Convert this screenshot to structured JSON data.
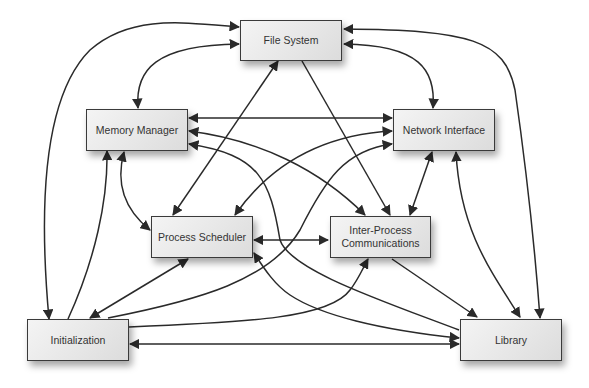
{
  "diagram": {
    "type": "module-dependency-graph",
    "nodes": [
      {
        "id": "fs",
        "label": "File System",
        "lines": [
          "File System"
        ]
      },
      {
        "id": "mm",
        "label": "Memory Manager",
        "lines": [
          "Memory Manager"
        ]
      },
      {
        "id": "ni",
        "label": "Network Interface",
        "lines": [
          "Network Interface"
        ]
      },
      {
        "id": "ps",
        "label": "Process Scheduler",
        "lines": [
          "Process Scheduler"
        ]
      },
      {
        "id": "ipc",
        "label": "Inter-Process Communications",
        "lines": [
          "Inter-Process",
          "Communications"
        ]
      },
      {
        "id": "init",
        "label": "Initialization",
        "lines": [
          "Initialization"
        ]
      },
      {
        "id": "lib",
        "label": "Library",
        "lines": [
          "Library"
        ]
      }
    ],
    "edges": [
      {
        "from": "init",
        "to": "fs",
        "direction": "both"
      },
      {
        "from": "mm",
        "to": "fs",
        "direction": "both"
      },
      {
        "from": "ni",
        "to": "fs",
        "direction": "both"
      },
      {
        "from": "lib",
        "to": "fs",
        "direction": "both"
      },
      {
        "from": "ps",
        "to": "fs",
        "direction": "both"
      },
      {
        "from": "fs",
        "to": "ipc",
        "direction": "forward"
      },
      {
        "from": "mm",
        "to": "ni",
        "direction": "both"
      },
      {
        "from": "mm",
        "to": "ipc",
        "direction": "both"
      },
      {
        "from": "lib",
        "to": "mm",
        "direction": "forward"
      },
      {
        "from": "init",
        "to": "mm",
        "direction": "forward"
      },
      {
        "from": "mm",
        "to": "ps",
        "direction": "both"
      },
      {
        "from": "ps",
        "to": "ni",
        "direction": "both"
      },
      {
        "from": "init",
        "to": "ni",
        "direction": "forward"
      },
      {
        "from": "ipc",
        "to": "ni",
        "direction": "both"
      },
      {
        "from": "lib",
        "to": "ni",
        "direction": "both"
      },
      {
        "from": "ps",
        "to": "ipc",
        "direction": "both"
      },
      {
        "from": "init",
        "to": "ps",
        "direction": "both"
      },
      {
        "from": "lib",
        "to": "ps",
        "direction": "both"
      },
      {
        "from": "init",
        "to": "ipc",
        "direction": "forward"
      },
      {
        "from": "ipc",
        "to": "lib",
        "direction": "forward"
      },
      {
        "from": "init",
        "to": "lib",
        "direction": "both"
      }
    ]
  }
}
